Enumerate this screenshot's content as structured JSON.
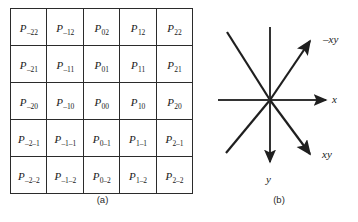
{
  "figure": {
    "background_color": "#ffffff",
    "line_color": "#2b2b2b"
  },
  "panel_a": {
    "caption": "(a)",
    "rows": [
      [
        {
          "base": "P",
          "sub": "–22"
        },
        {
          "base": "P",
          "sub": "–12"
        },
        {
          "base": "P",
          "sub": "02"
        },
        {
          "base": "P",
          "sub": "12"
        },
        {
          "base": "P",
          "sub": "22"
        }
      ],
      [
        {
          "base": "P",
          "sub": "–21"
        },
        {
          "base": "P",
          "sub": "–11"
        },
        {
          "base": "P",
          "sub": "01"
        },
        {
          "base": "P",
          "sub": "11"
        },
        {
          "base": "P",
          "sub": "21"
        }
      ],
      [
        {
          "base": "P",
          "sub": "–20"
        },
        {
          "base": "P",
          "sub": "–10"
        },
        {
          "base": "P",
          "sub": "00"
        },
        {
          "base": "P",
          "sub": "10"
        },
        {
          "base": "P",
          "sub": "20"
        }
      ],
      [
        {
          "base": "P",
          "sub": "–2–1"
        },
        {
          "base": "P",
          "sub": "–1–1"
        },
        {
          "base": "P",
          "sub": "0–1"
        },
        {
          "base": "P",
          "sub": "1–1"
        },
        {
          "base": "P",
          "sub": "2–1"
        }
      ],
      [
        {
          "base": "P",
          "sub": "–2–2"
        },
        {
          "base": "P",
          "sub": "–1–2"
        },
        {
          "base": "P",
          "sub": "0–2"
        },
        {
          "base": "P",
          "sub": "1–2"
        },
        {
          "base": "P",
          "sub": "2–2"
        }
      ]
    ]
  },
  "panel_b": {
    "caption": "(b)",
    "labels": {
      "x_axis": "x",
      "y_axis": "y",
      "diag_up": "–xy",
      "diag_down": "xy"
    }
  }
}
